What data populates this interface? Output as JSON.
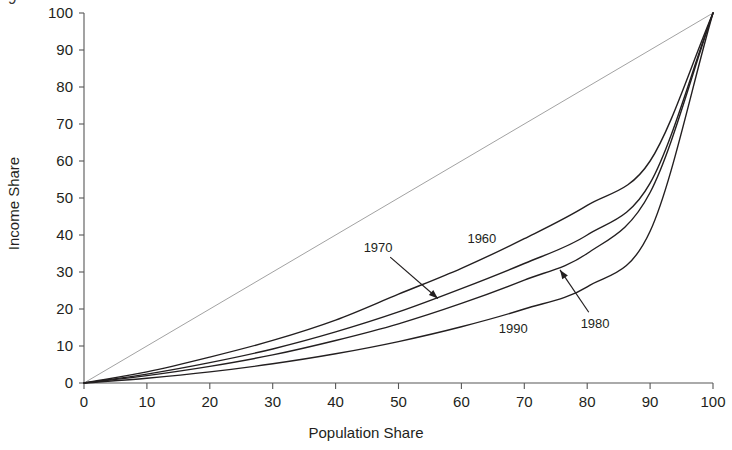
{
  "chart_data": {
    "type": "line",
    "title": "",
    "xlabel": "Population Share",
    "ylabel": "Income Share",
    "xlim": [
      0,
      100
    ],
    "ylim": [
      0,
      100
    ],
    "grid": false,
    "legend_position": "inline-annotations",
    "xticks": [
      0,
      10,
      20,
      30,
      40,
      50,
      60,
      70,
      80,
      90,
      100
    ],
    "yticks": [
      0,
      10,
      20,
      30,
      40,
      50,
      60,
      70,
      80,
      90,
      100
    ],
    "xtick_labels": [
      "0",
      "10",
      "20",
      "30",
      "40",
      "50",
      "60",
      "70",
      "80",
      "90",
      "100"
    ],
    "ytick_labels": [
      "0",
      "10",
      "20",
      "30",
      "40",
      "50",
      "60",
      "70",
      "80",
      "90",
      "100"
    ],
    "x": [
      0,
      10,
      20,
      30,
      40,
      50,
      60,
      70,
      80,
      90,
      100
    ],
    "series": [
      {
        "name": "equality-line",
        "label": "",
        "values": [
          0,
          10,
          20,
          30,
          40,
          50,
          60,
          70,
          80,
          90,
          100
        ],
        "color": "#8a8a8a",
        "width": 0.8
      },
      {
        "name": "1960",
        "label": "1960",
        "values": [
          0,
          3.0,
          7.0,
          11.5,
          17.0,
          24.0,
          31.0,
          39.0,
          48.0,
          60.0,
          100
        ],
        "color": "#231f20",
        "width": 1.4
      },
      {
        "name": "1970",
        "label": "1970",
        "values": [
          0,
          2.4,
          5.5,
          9.2,
          13.8,
          19.2,
          25.5,
          32.3,
          40.0,
          54.0,
          100
        ],
        "color": "#231f20",
        "width": 1.4
      },
      {
        "name": "1980",
        "label": "1980",
        "values": [
          0,
          2.0,
          4.5,
          7.6,
          11.5,
          16.0,
          21.5,
          27.8,
          35.0,
          51.5,
          100
        ],
        "color": "#231f20",
        "width": 1.4
      },
      {
        "name": "1990",
        "label": "1990",
        "values": [
          0,
          1.3,
          3.0,
          5.2,
          7.9,
          11.2,
          15.2,
          20.0,
          26.0,
          41.0,
          100
        ],
        "color": "#231f20",
        "width": 1.4
      }
    ],
    "annotations": [
      {
        "text": "1960",
        "type": "text-label",
        "x": 63.5,
        "y": 39.0
      },
      {
        "text": "1970",
        "type": "arrow-label",
        "x": 47.0,
        "y": 36.5,
        "arrow_to_x": 56.5,
        "arrow_to_y": 22.5
      },
      {
        "text": "1980",
        "type": "arrow-label",
        "x": 81.5,
        "y": 16.0,
        "arrow_to_x": 75.5,
        "arrow_to_y": 31.0
      },
      {
        "text": "1990",
        "type": "text-label",
        "x": 68.5,
        "y": 14.5
      }
    ]
  },
  "figure": {
    "caption_fragment": "9"
  }
}
